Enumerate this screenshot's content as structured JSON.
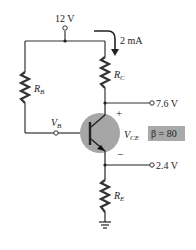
{
  "diagram": {
    "type": "BJT fixed-bias circuit with emitter resistor",
    "supply": {
      "label": "12 V"
    },
    "current": {
      "label": "2 mA"
    },
    "resistors": {
      "rb": {
        "name": "R",
        "sub": "B"
      },
      "rc": {
        "name": "R",
        "sub": "C"
      },
      "re": {
        "name": "R",
        "sub": "E"
      }
    },
    "nodes": {
      "collector": {
        "label": "7.6 V"
      },
      "emitter": {
        "label": "2.4 V"
      },
      "base": {
        "name": "V",
        "sub": "B"
      }
    },
    "vce": {
      "name": "V",
      "sub": "CE",
      "plus": "+",
      "minus": "−"
    },
    "beta": {
      "label": "β = 80"
    },
    "colors": {
      "wire": "#333333",
      "transistor_body": "#a6a6a6",
      "beta_box": "#a9a9a9"
    }
  }
}
